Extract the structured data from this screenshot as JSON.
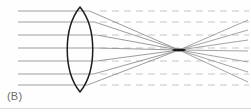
{
  "figure": {
    "label": "(B)",
    "caption_text": "(B)",
    "type": "optics-ray-diagram",
    "width": 251,
    "height": 112,
    "background_color": "#fefefe"
  },
  "colors": {
    "ray": "#8e8e8e",
    "refracted_ray": "#8a8a8a",
    "diverging_ray": "#949494",
    "dashed_axis": "#c2c2c2",
    "lens_outline": "#1d1d1d",
    "focal_point": "#1b1b1b",
    "label_text": "#6d6d6d",
    "page_edge": "#d7d7d7"
  },
  "lens": {
    "name": "biconvex-converging-lens",
    "center_x": 80,
    "top_vertex_y": 7,
    "bottom_vertex_y": 92,
    "half_width": 17,
    "left_edge_x": 63,
    "right_edge_x": 97,
    "path": "M 80 7 C 63 28 63 71 80 92 C 97 71 97 28 80 7 Z"
  },
  "focal_point": {
    "name": "focal-point",
    "x": 179,
    "y": 50,
    "blob_rx": 7,
    "blob_ry": 1.4
  },
  "incident_rays": {
    "count": 7,
    "start_x": 18,
    "y_values": [
      11,
      22,
      35,
      48,
      61,
      74,
      85
    ],
    "entry_x_values": [
      70.5,
      65.5,
      63.2,
      63.0,
      63.6,
      66.5,
      72.5
    ]
  },
  "refracted_rays": {
    "count": 7,
    "exit_x_values": [
      89.5,
      94.5,
      96.8,
      97.0,
      96.4,
      93.5,
      87.5
    ],
    "exit_y_values": [
      11,
      22,
      35,
      48,
      61,
      74,
      85
    ],
    "converge_x": 179,
    "converge_y": 50
  },
  "diverging_rays": {
    "count": 7,
    "end_x": 248,
    "end_y_values": [
      82,
      72,
      62,
      51,
      40,
      30,
      20
    ]
  },
  "dashed_axes": {
    "count": 7,
    "start_x": 100,
    "end_x": 249,
    "y_values": [
      11,
      22,
      35,
      48,
      61,
      74,
      85
    ],
    "dash_on": 7,
    "dash_off": 5
  },
  "page_edge": {
    "name": "page-bottom-edge",
    "y": 108.5,
    "x_start": 0,
    "x_end": 251
  }
}
